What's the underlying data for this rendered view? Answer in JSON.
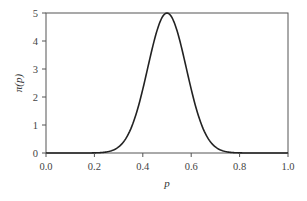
{
  "chart_data": {
    "type": "line",
    "title": "",
    "xlabel": "p",
    "ylabel": "π(p)",
    "xlim": [
      0.0,
      1.0
    ],
    "ylim": [
      0,
      5
    ],
    "xticks": [
      "0.0",
      "0.2",
      "0.4",
      "0.6",
      "0.8",
      "1.0"
    ],
    "yticks": [
      "0",
      "1",
      "2",
      "3",
      "4",
      "5"
    ],
    "grid": false,
    "legend": null,
    "series": [
      {
        "name": "π(p)",
        "color": "#222222",
        "x": [
          0.0,
          0.1,
          0.2,
          0.25,
          0.3,
          0.35,
          0.4,
          0.45,
          0.5,
          0.55,
          0.6,
          0.65,
          0.7,
          0.75,
          0.8,
          0.9,
          1.0
        ],
        "values": [
          0.0,
          0.0,
          0.04,
          0.19,
          0.22,
          0.86,
          2.28,
          4.12,
          5.0,
          4.12,
          2.28,
          0.86,
          0.22,
          0.19,
          0.04,
          0.0,
          0.0
        ]
      }
    ],
    "curve_model": {
      "kind": "normal",
      "mean": 0.5,
      "sd": 0.0798
    }
  }
}
